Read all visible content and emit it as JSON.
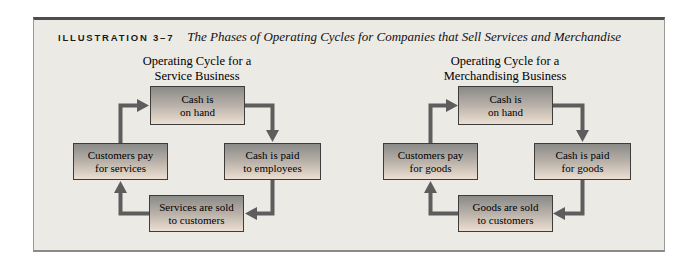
{
  "header": {
    "label": "ILLUSTRATION 3–7",
    "title": "The Phases of Operating Cycles for Companies that Sell Services and Merchandise"
  },
  "diagrams": [
    {
      "title_line1": "Operating Cycle for a",
      "title_line2": "Service Business",
      "boxes": {
        "top": {
          "line1": "Cash is",
          "line2": "on hand"
        },
        "right": {
          "line1": "Cash is paid",
          "line2": "to employees"
        },
        "bottom": {
          "line1": "Services are sold",
          "line2": "to customers"
        },
        "left": {
          "line1": "Customers pay",
          "line2": "for services"
        }
      }
    },
    {
      "title_line1": "Operating Cycle for a",
      "title_line2": "Merchandising Business",
      "boxes": {
        "top": {
          "line1": "Cash is",
          "line2": "on hand"
        },
        "right": {
          "line1": "Cash is paid",
          "line2": "for goods"
        },
        "bottom": {
          "line1": "Goods are sold",
          "line2": "to customers"
        },
        "left": {
          "line1": "Customers pay",
          "line2": "for goods"
        }
      }
    }
  ],
  "colors": {
    "panel_background": "#ECEAE5",
    "panel_top_rule": "#4D4D4D",
    "panel_border": "#9A9A97",
    "box_border": "#3D3D3D",
    "box_gradient_top": "#8A8A88",
    "box_gradient_bottom": "#ECDFD2",
    "arrow": "#5D5D5D",
    "text": "#000000"
  }
}
